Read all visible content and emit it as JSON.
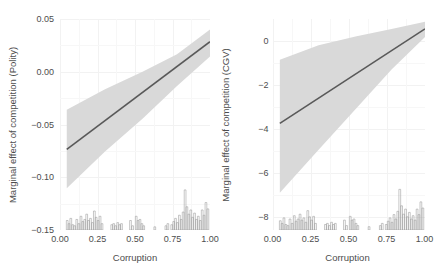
{
  "chart_data": [
    {
      "type": "line",
      "panel": "left",
      "title": "",
      "xlabel": "Corruption",
      "ylabel": "Marginal effect of competition (Polity)",
      "xlim": [
        0.0,
        1.0
      ],
      "ylim": [
        -0.15,
        0.05
      ],
      "xticks": [
        "0.00",
        "0.25",
        "0.50",
        "0.75",
        "1.00"
      ],
      "xtick_values": [
        0.0,
        0.25,
        0.5,
        0.75,
        1.0
      ],
      "yticks": [
        "0.05",
        "0.00",
        "-0.05",
        "-0.10",
        "-0.15"
      ],
      "ytick_values": [
        0.05,
        0.0,
        -0.05,
        -0.1,
        -0.15
      ],
      "grid": true,
      "legend": "none",
      "series": [
        {
          "name": "Marginal effect",
          "kind": "line",
          "color": "#595959",
          "x": [
            0.045,
            1.0
          ],
          "y": [
            -0.0735,
            0.0285
          ]
        },
        {
          "name": "95% confidence band",
          "kind": "ribbon",
          "color": "#d9d9d9",
          "x": [
            0.045,
            0.3,
            0.55,
            0.78,
            1.0
          ],
          "ymin": [
            -0.1105,
            -0.0755,
            -0.0445,
            -0.0135,
            0.0145
          ],
          "ymax": [
            -0.036,
            -0.0165,
            0.0,
            0.0165,
            0.04
          ]
        }
      ],
      "rug": {
        "name": "Corruption distribution",
        "color": "#999999",
        "baseline": -0.15,
        "max_height": 0.038,
        "bins": [
          {
            "x": 0.048,
            "h": 0.009
          },
          {
            "x": 0.06,
            "h": 0.006
          },
          {
            "x": 0.072,
            "h": 0.011
          },
          {
            "x": 0.085,
            "h": 0.005
          },
          {
            "x": 0.098,
            "h": 0.004
          },
          {
            "x": 0.112,
            "h": 0.01
          },
          {
            "x": 0.126,
            "h": 0.006
          },
          {
            "x": 0.14,
            "h": 0.013
          },
          {
            "x": 0.152,
            "h": 0.008
          },
          {
            "x": 0.165,
            "h": 0.01
          },
          {
            "x": 0.178,
            "h": 0.015
          },
          {
            "x": 0.19,
            "h": 0.009
          },
          {
            "x": 0.203,
            "h": 0.011
          },
          {
            "x": 0.216,
            "h": 0.007
          },
          {
            "x": 0.229,
            "h": 0.018
          },
          {
            "x": 0.241,
            "h": 0.012
          },
          {
            "x": 0.254,
            "h": 0.009
          },
          {
            "x": 0.267,
            "h": 0.013
          },
          {
            "x": 0.28,
            "h": 0.006
          },
          {
            "x": 0.345,
            "h": 0.005
          },
          {
            "x": 0.358,
            "h": 0.006
          },
          {
            "x": 0.371,
            "h": 0.004
          },
          {
            "x": 0.385,
            "h": 0.007
          },
          {
            "x": 0.398,
            "h": 0.005
          },
          {
            "x": 0.41,
            "h": 0.006
          },
          {
            "x": 0.47,
            "h": 0.009
          },
          {
            "x": 0.484,
            "h": 0.004
          },
          {
            "x": 0.508,
            "h": 0.013
          },
          {
            "x": 0.52,
            "h": 0.009
          },
          {
            "x": 0.533,
            "h": 0.01
          },
          {
            "x": 0.546,
            "h": 0.006
          },
          {
            "x": 0.558,
            "h": 0.004
          },
          {
            "x": 0.632,
            "h": 0.003
          },
          {
            "x": 0.706,
            "h": 0.004
          },
          {
            "x": 0.719,
            "h": 0.006
          },
          {
            "x": 0.745,
            "h": 0.005
          },
          {
            "x": 0.758,
            "h": 0.008
          },
          {
            "x": 0.77,
            "h": 0.011
          },
          {
            "x": 0.783,
            "h": 0.007
          },
          {
            "x": 0.796,
            "h": 0.014
          },
          {
            "x": 0.808,
            "h": 0.01
          },
          {
            "x": 0.821,
            "h": 0.017
          },
          {
            "x": 0.834,
            "h": 0.038
          },
          {
            "x": 0.846,
            "h": 0.022
          },
          {
            "x": 0.859,
            "h": 0.015
          },
          {
            "x": 0.872,
            "h": 0.019
          },
          {
            "x": 0.884,
            "h": 0.012
          },
          {
            "x": 0.897,
            "h": 0.016
          },
          {
            "x": 0.91,
            "h": 0.01
          },
          {
            "x": 0.922,
            "h": 0.013
          },
          {
            "x": 0.935,
            "h": 0.009
          },
          {
            "x": 0.948,
            "h": 0.019
          },
          {
            "x": 0.96,
            "h": 0.014
          },
          {
            "x": 0.973,
            "h": 0.026
          },
          {
            "x": 0.986,
            "h": 0.02
          }
        ]
      }
    },
    {
      "type": "line",
      "panel": "right",
      "title": "",
      "xlabel": "Corruption",
      "ylabel": "Marginal effect of competition (CGV)",
      "xlim": [
        0.0,
        1.0
      ],
      "ylim": [
        -8.6,
        1.0
      ],
      "xticks": [
        "0.00",
        "0.25",
        "0.50",
        "0.75",
        "1.00"
      ],
      "xtick_values": [
        0.0,
        0.25,
        0.5,
        0.75,
        1.0
      ],
      "yticks": [
        "0",
        "-2",
        "-4",
        "-6",
        "-8"
      ],
      "ytick_values": [
        0,
        -2,
        -4,
        -6,
        -8
      ],
      "grid": true,
      "legend": "none",
      "series": [
        {
          "name": "Marginal effect",
          "kind": "line",
          "color": "#595959",
          "x": [
            0.045,
            1.0
          ],
          "y": [
            -3.75,
            0.55
          ]
        },
        {
          "name": "95% confidence band",
          "kind": "ribbon",
          "color": "#d9d9d9",
          "x": [
            0.045,
            0.3,
            0.55,
            0.78,
            1.0
          ],
          "ymin": [
            -6.9,
            -4.95,
            -3.05,
            -1.3,
            0.18
          ],
          "ymax": [
            -0.85,
            -0.2,
            0.22,
            0.55,
            0.88
          ]
        }
      ],
      "rug": {
        "name": "Corruption distribution",
        "color": "#999999",
        "baseline": -8.6,
        "max_height": 1.85,
        "bins": [
          {
            "x": 0.048,
            "h": 0.42
          },
          {
            "x": 0.06,
            "h": 0.3
          },
          {
            "x": 0.072,
            "h": 0.55
          },
          {
            "x": 0.085,
            "h": 0.25
          },
          {
            "x": 0.098,
            "h": 0.2
          },
          {
            "x": 0.112,
            "h": 0.5
          },
          {
            "x": 0.126,
            "h": 0.3
          },
          {
            "x": 0.14,
            "h": 0.65
          },
          {
            "x": 0.152,
            "h": 0.4
          },
          {
            "x": 0.165,
            "h": 0.5
          },
          {
            "x": 0.178,
            "h": 0.72
          },
          {
            "x": 0.19,
            "h": 0.45
          },
          {
            "x": 0.203,
            "h": 0.55
          },
          {
            "x": 0.216,
            "h": 0.35
          },
          {
            "x": 0.229,
            "h": 0.88
          },
          {
            "x": 0.241,
            "h": 0.6
          },
          {
            "x": 0.254,
            "h": 0.45
          },
          {
            "x": 0.267,
            "h": 0.62
          },
          {
            "x": 0.28,
            "h": 0.3
          },
          {
            "x": 0.345,
            "h": 0.25
          },
          {
            "x": 0.358,
            "h": 0.3
          },
          {
            "x": 0.371,
            "h": 0.2
          },
          {
            "x": 0.385,
            "h": 0.35
          },
          {
            "x": 0.398,
            "h": 0.25
          },
          {
            "x": 0.41,
            "h": 0.3
          },
          {
            "x": 0.47,
            "h": 0.45
          },
          {
            "x": 0.484,
            "h": 0.2
          },
          {
            "x": 0.508,
            "h": 0.62
          },
          {
            "x": 0.52,
            "h": 0.45
          },
          {
            "x": 0.533,
            "h": 0.5
          },
          {
            "x": 0.546,
            "h": 0.3
          },
          {
            "x": 0.558,
            "h": 0.2
          },
          {
            "x": 0.632,
            "h": 0.15
          },
          {
            "x": 0.706,
            "h": 0.2
          },
          {
            "x": 0.719,
            "h": 0.3
          },
          {
            "x": 0.745,
            "h": 0.25
          },
          {
            "x": 0.758,
            "h": 0.4
          },
          {
            "x": 0.77,
            "h": 0.55
          },
          {
            "x": 0.783,
            "h": 0.35
          },
          {
            "x": 0.796,
            "h": 0.7
          },
          {
            "x": 0.808,
            "h": 0.5
          },
          {
            "x": 0.821,
            "h": 0.85
          },
          {
            "x": 0.834,
            "h": 1.85
          },
          {
            "x": 0.846,
            "h": 1.1
          },
          {
            "x": 0.859,
            "h": 0.72
          },
          {
            "x": 0.872,
            "h": 0.95
          },
          {
            "x": 0.884,
            "h": 0.6
          },
          {
            "x": 0.897,
            "h": 0.8
          },
          {
            "x": 0.91,
            "h": 0.5
          },
          {
            "x": 0.922,
            "h": 0.65
          },
          {
            "x": 0.935,
            "h": 0.45
          },
          {
            "x": 0.948,
            "h": 0.95
          },
          {
            "x": 0.96,
            "h": 0.7
          },
          {
            "x": 0.973,
            "h": 1.28
          },
          {
            "x": 0.986,
            "h": 1.0
          }
        ]
      }
    }
  ],
  "colors": {
    "line": "#595959",
    "band": "#d9d9d9",
    "rug": "#999999",
    "grid": "#f2f2f2",
    "text": "#4d4d4d",
    "background": "#ffffff"
  }
}
